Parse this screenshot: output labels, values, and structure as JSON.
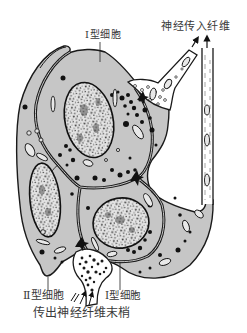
{
  "figure": {
    "labels": {
      "type1_top": "Ⅰ型细胞",
      "afferent": "神经传入纤维",
      "type2_bottom": "Ⅱ型细胞",
      "type1_bottom": "Ⅰ型细胞",
      "efferent": "传出神经纤维末梢"
    },
    "colors": {
      "background": "#ffffff",
      "cytoplasm": "#c6c6c6",
      "outline": "#1a1a1a",
      "nerve_fiber": "#ffffff",
      "text": "#3a3a3a"
    }
  }
}
